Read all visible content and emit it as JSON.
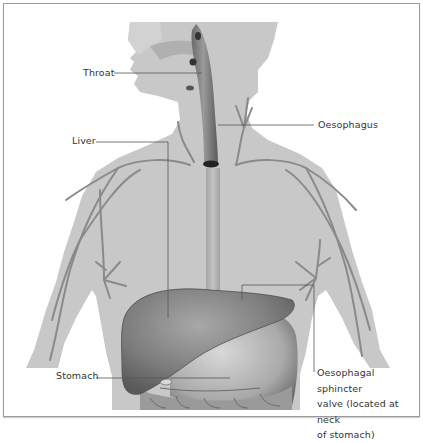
{
  "figure": {
    "type": "anatomical illustration",
    "colors": {
      "body": "#c9c9c9",
      "vessels": "#8a8a8a",
      "organ": "#7d7d7d",
      "border": "#9a9a9a",
      "label_text": "#333333",
      "leader_line": "#555555"
    }
  },
  "labels": {
    "throat": "Throat",
    "liver": "Liver",
    "oesophagus": "Oesophagus",
    "stomach": "Stomach",
    "sphincter": {
      "line1": "Oesophagal sphincter",
      "line2": "valve (located at neck",
      "line3": "of stomach)"
    }
  }
}
